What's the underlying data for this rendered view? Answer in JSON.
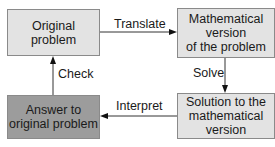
{
  "diagram": {
    "boxes": {
      "original_problem": {
        "lines": [
          "Original",
          "problem"
        ],
        "fill": "#e3e3e3"
      },
      "math_version": {
        "lines": [
          "Mathematical",
          "version",
          "of the problem"
        ],
        "fill": "#e3e3e3"
      },
      "solution": {
        "lines": [
          "Solution to the",
          "mathematical",
          "version"
        ],
        "fill": "#e3e3e3"
      },
      "answer": {
        "lines": [
          "Answer to",
          "original problem"
        ],
        "fill": "#9c9c9c"
      }
    },
    "edges": {
      "translate": "Translate",
      "solve": "Solve",
      "interpret": "Interpret",
      "check": "Check"
    }
  }
}
